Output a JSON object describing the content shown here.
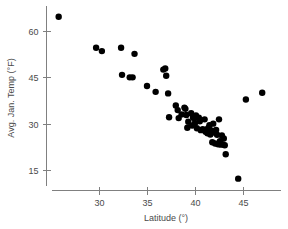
{
  "chart_data": {
    "type": "scatter",
    "title": "",
    "xlabel": "Latitude (°)",
    "ylabel": "Avg. Jan. Temp (°F)",
    "xlim": [
      25.5,
      47.8
    ],
    "ylim": [
      10.0,
      65.5
    ],
    "xticks": [
      30,
      35,
      40,
      45
    ],
    "yticks": [
      15,
      30,
      45,
      60
    ],
    "xtick_labels": [
      "30",
      "35",
      "40",
      "45"
    ],
    "ytick_labels": [
      "15",
      "30",
      "45",
      "60"
    ],
    "grid": false,
    "legend": "none",
    "marker": "filled-circle",
    "marker_color": "#000000",
    "marker_size": 3.2,
    "series": [
      {
        "name": "US cities",
        "points": [
          {
            "x": 25.8,
            "y": 64.6
          },
          {
            "x": 29.7,
            "y": 54.6
          },
          {
            "x": 30.3,
            "y": 53.5
          },
          {
            "x": 32.3,
            "y": 54.6
          },
          {
            "x": 32.4,
            "y": 45.8
          },
          {
            "x": 33.2,
            "y": 45.0
          },
          {
            "x": 33.5,
            "y": 45.0
          },
          {
            "x": 33.7,
            "y": 52.6
          },
          {
            "x": 35.0,
            "y": 42.2
          },
          {
            "x": 35.9,
            "y": 40.3
          },
          {
            "x": 36.7,
            "y": 47.5
          },
          {
            "x": 36.9,
            "y": 47.9
          },
          {
            "x": 37.0,
            "y": 45.5
          },
          {
            "x": 37.2,
            "y": 39.8
          },
          {
            "x": 37.3,
            "y": 32.1
          },
          {
            "x": 38.0,
            "y": 35.9
          },
          {
            "x": 38.2,
            "y": 34.4
          },
          {
            "x": 38.3,
            "y": 31.8
          },
          {
            "x": 38.6,
            "y": 33.0
          },
          {
            "x": 38.9,
            "y": 35.2
          },
          {
            "x": 39.0,
            "y": 34.8
          },
          {
            "x": 39.1,
            "y": 32.8
          },
          {
            "x": 39.2,
            "y": 28.7
          },
          {
            "x": 39.3,
            "y": 30.6
          },
          {
            "x": 39.6,
            "y": 33.4
          },
          {
            "x": 39.7,
            "y": 29.4
          },
          {
            "x": 39.8,
            "y": 32.0
          },
          {
            "x": 39.9,
            "y": 31.8
          },
          {
            "x": 40.0,
            "y": 30.2
          },
          {
            "x": 40.1,
            "y": 32.7
          },
          {
            "x": 40.2,
            "y": 28.5
          },
          {
            "x": 40.4,
            "y": 31.9
          },
          {
            "x": 40.5,
            "y": 30.8
          },
          {
            "x": 40.6,
            "y": 27.9
          },
          {
            "x": 40.8,
            "y": 28.2
          },
          {
            "x": 41.0,
            "y": 31.4
          },
          {
            "x": 41.1,
            "y": 27.4
          },
          {
            "x": 41.2,
            "y": 28.1
          },
          {
            "x": 41.3,
            "y": 26.9
          },
          {
            "x": 41.4,
            "y": 28.6
          },
          {
            "x": 41.5,
            "y": 29.5
          },
          {
            "x": 41.6,
            "y": 26.5
          },
          {
            "x": 41.7,
            "y": 27.8
          },
          {
            "x": 41.8,
            "y": 24.0
          },
          {
            "x": 41.9,
            "y": 30.0
          },
          {
            "x": 42.0,
            "y": 27.1
          },
          {
            "x": 42.1,
            "y": 23.6
          },
          {
            "x": 42.2,
            "y": 28.0
          },
          {
            "x": 42.3,
            "y": 26.4
          },
          {
            "x": 42.4,
            "y": 23.3
          },
          {
            "x": 42.5,
            "y": 31.4
          },
          {
            "x": 42.6,
            "y": 24.3
          },
          {
            "x": 42.7,
            "y": 23.2
          },
          {
            "x": 42.8,
            "y": 26.2
          },
          {
            "x": 42.9,
            "y": 23.3
          },
          {
            "x": 43.0,
            "y": 25.2
          },
          {
            "x": 43.1,
            "y": 23.0
          },
          {
            "x": 43.2,
            "y": 20.1
          },
          {
            "x": 44.5,
            "y": 12.2
          },
          {
            "x": 45.3,
            "y": 37.8
          },
          {
            "x": 47.0,
            "y": 40.0
          }
        ]
      }
    ]
  },
  "figure": {
    "background": "#ffffff",
    "axis_color": "#808080",
    "text_color": "#4a4a4a"
  }
}
